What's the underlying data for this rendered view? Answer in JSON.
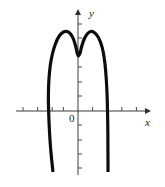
{
  "figure": {
    "name": "polynomial-graph",
    "background_color": "#ffffff",
    "width": 165,
    "height": 187
  },
  "labels": {
    "y_axis": "y",
    "x_axis": "x",
    "origin": "0"
  },
  "style": {
    "curve_color": "#0d0d0d",
    "curve_width": 3.2,
    "axis_color": "#3a3a3a",
    "axis_width": 1,
    "tick_color": "#4a4a4a",
    "tick_width": 1,
    "tick_length": 4
  },
  "chart_data": {
    "type": "line",
    "title": "",
    "xlabel": "x",
    "ylabel": "y",
    "grid": false,
    "legend": null,
    "axes": {
      "origin_px": [
        78,
        111
      ],
      "unit_px": 14.6,
      "x_axis_px": {
        "start": [
          16,
          111
        ],
        "end": [
          150,
          111
        ]
      },
      "y_axis_px": {
        "start": [
          78,
          175
        ],
        "end": [
          78,
          10
        ]
      },
      "x_arrow": "right",
      "y_arrow": "up",
      "x_ticks_px": [
        23,
        37.6,
        52.2,
        63.4,
        78,
        92.6,
        107.2,
        121.8,
        136.4
      ],
      "y_ticks_px": [
        24,
        38,
        53,
        67,
        82,
        96,
        125,
        140,
        154,
        168
      ],
      "xlim_units": [
        -4.2,
        4.9
      ],
      "ylim_units": [
        -4.4,
        6.9
      ]
    },
    "curve": {
      "description": "quartic-like polynomial, W-shaped crest with two maxima and a local minimum at x=0, falling steeply through two x-intercepts",
      "x_intercepts_units": [
        -1.7,
        1.7
      ],
      "local_maxima_units": [
        [
          -1.0,
          5.2
        ],
        [
          0.85,
          5.2
        ]
      ],
      "local_minimum_units": [
        0.0,
        3.8
      ],
      "endpoints_px": [
        [
          53,
          172
        ],
        [
          108,
          172
        ]
      ],
      "points_px": [
        [
          53,
          172
        ],
        [
          51.5,
          158
        ],
        [
          50.2,
          143
        ],
        [
          49.2,
          126
        ],
        [
          48.6,
          110
        ],
        [
          48.4,
          95
        ],
        [
          48.9,
          80
        ],
        [
          50.2,
          66
        ],
        [
          52.4,
          54
        ],
        [
          55.4,
          44
        ],
        [
          59.2,
          36
        ],
        [
          63.4,
          32
        ],
        [
          67.2,
          31.5
        ],
        [
          70.6,
          34
        ],
        [
          73.4,
          39
        ],
        [
          75.6,
          46
        ],
        [
          77.2,
          53
        ],
        [
          78.4,
          56
        ],
        [
          80.0,
          53
        ],
        [
          81.8,
          46
        ],
        [
          84.2,
          39
        ],
        [
          87.2,
          34
        ],
        [
          90.6,
          31.5
        ],
        [
          94.2,
          32.5
        ],
        [
          97.8,
          36.5
        ],
        [
          100.8,
          43
        ],
        [
          103.2,
          52
        ],
        [
          105.0,
          64
        ],
        [
          106.2,
          78
        ],
        [
          107.0,
          93
        ],
        [
          107.5,
          110
        ],
        [
          107.8,
          128
        ],
        [
          107.9,
          146
        ],
        [
          108.0,
          162
        ],
        [
          108.0,
          172
        ]
      ]
    }
  }
}
